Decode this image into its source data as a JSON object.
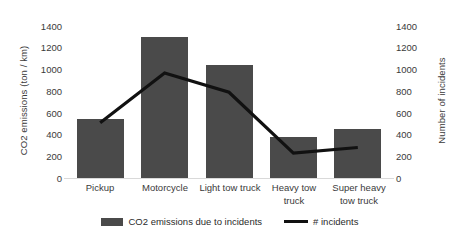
{
  "chart_data": {
    "type": "bar",
    "title": "",
    "categories": [
      "Pickup",
      "Motorcycle",
      "Light tow truck",
      "Heavy tow truck",
      "Super heavy tow truck"
    ],
    "series": [
      {
        "name": "CO2 emissions due to incidents",
        "type": "bar",
        "axis": "left",
        "color": "#4a4a4a",
        "values": [
          520,
          1250,
          1000,
          365,
          430
        ]
      },
      {
        "name": "# incidents",
        "type": "line",
        "axis": "right",
        "color": "#111111",
        "values": [
          490,
          930,
          760,
          220,
          270
        ]
      }
    ],
    "xlabel": "",
    "ylabel": "CO2 emissions (ton / km)",
    "y2label": "Number of incidents",
    "ylim": [
      0,
      1400
    ],
    "y2lim": [
      0,
      1400
    ],
    "yticks": [
      0,
      200,
      400,
      600,
      800,
      1000,
      1200,
      1400
    ],
    "y2ticks": [
      0,
      200,
      400,
      600,
      800,
      1000,
      1200,
      1400
    ],
    "grid": false,
    "legend_position": "bottom"
  },
  "axes": {
    "left_title": "CO2 emissions (ton / km)",
    "right_title": "Number of incidents",
    "left_ticks": [
      "1400",
      "1200",
      "1000",
      "800",
      "600",
      "400",
      "200",
      "0"
    ],
    "right_ticks": [
      "1400",
      "1200",
      "1000",
      "800",
      "600",
      "400",
      "200",
      "0"
    ]
  },
  "categories": [
    {
      "line1": "Pickup",
      "line2": ""
    },
    {
      "line1": "Motorcycle",
      "line2": ""
    },
    {
      "line1": "Light tow truck",
      "line2": ""
    },
    {
      "line1": "Heavy tow",
      "line2": "truck"
    },
    {
      "line1": "Super heavy",
      "line2": "tow  truck"
    }
  ],
  "legend": {
    "items": [
      {
        "label": "CO2 emissions due to incidents",
        "marker": "bar-swatch",
        "color": "#4a4a4a"
      },
      {
        "label": "# incidents",
        "marker": "line-swatch",
        "color": "#111111"
      }
    ]
  }
}
